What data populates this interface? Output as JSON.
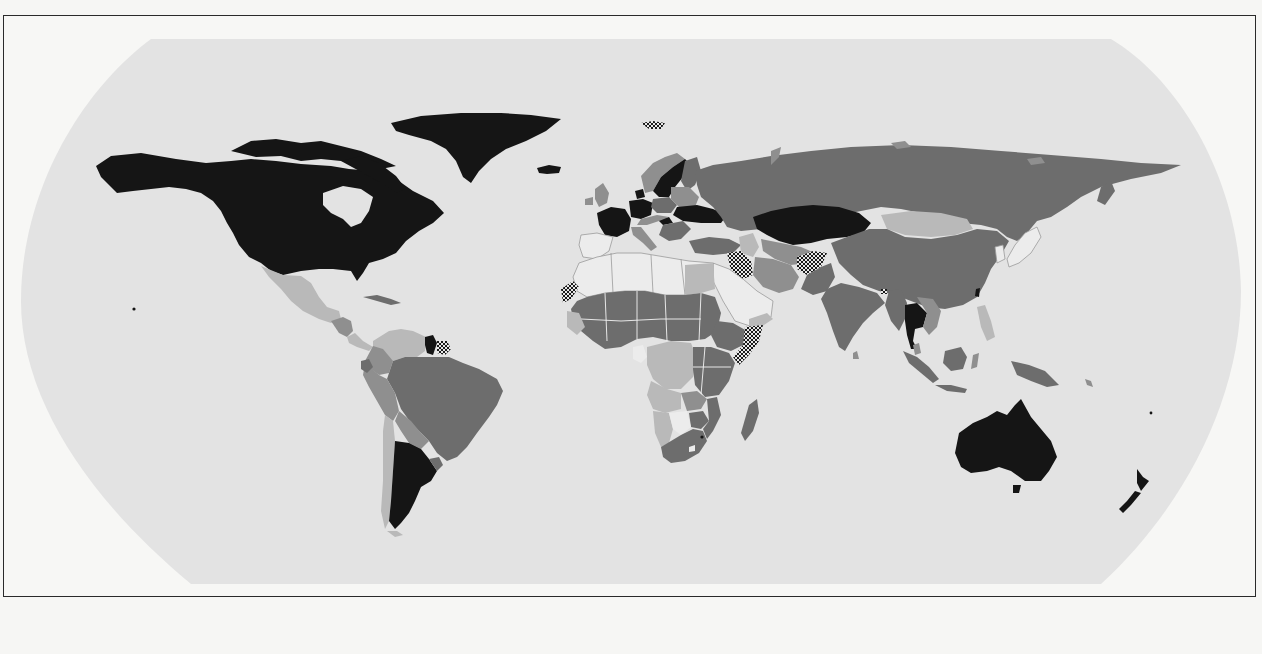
{
  "map": {
    "projection": "Robinson-style world choropleth (grayscale print)",
    "colors": {
      "paper": "#f7f7f5",
      "ocean": "#e4e4e4",
      "frame_border": "#2a2a2a",
      "category_black": "#151515",
      "category_dark_gray": "#6d6d6d",
      "category_mid_gray": "#8f8f8f",
      "category_light_gray": "#b9b9b9",
      "category_pale": "#ececec",
      "category_hatched": "checker pattern"
    },
    "legend_visible": false,
    "title_visible": false,
    "categories": [
      {
        "id": "black",
        "regions": [
          "Canada",
          "United States",
          "Greenland",
          "France",
          "Germany",
          "Denmark",
          "Sweden",
          "Ukraine",
          "Hungary",
          "Kazakhstan",
          "Thailand",
          "Australia",
          "New Zealand",
          "Argentina",
          "Guyana",
          "Taiwan",
          "Swaziland",
          "Iceland"
        ]
      },
      {
        "id": "dark_gray",
        "regions": [
          "Russia",
          "China",
          "India",
          "Brazil",
          "Turkey",
          "South Africa",
          "Madagascar",
          "Indonesia",
          "Papua New Guinea",
          "Ethiopia",
          "Kenya",
          "Tanzania",
          "Zimbabwe",
          "Mozambique",
          "Sudan",
          "Chad",
          "Niger",
          "Nigeria",
          "Mali",
          "Myanmar",
          "Pakistan",
          "Finland",
          "Poland",
          "Romania",
          "Uruguay",
          "Ecuador",
          "Guatemala",
          "Bolivia"
        ]
      },
      {
        "id": "mid_gray",
        "regions": [
          "Norway",
          "United Kingdom",
          "Ireland",
          "Italy",
          "Belarus",
          "Baltic states",
          "Iran",
          "Turkmenistan",
          "Uzbekistan",
          "Vietnam",
          "Laos",
          "Cambodia",
          "Malaysia",
          "Philippines",
          "Colombia",
          "Peru",
          "Paraguay",
          "Zambia",
          "Uganda",
          "Cameroon",
          "Central African Republic",
          "Senegal",
          "Mauritania",
          "Guinea"
        ]
      },
      {
        "id": "light_gray",
        "regions": [
          "Mexico",
          "Mongolia",
          "Venezuela",
          "Chile",
          "Democratic Republic of the Congo",
          "Angola",
          "Namibia",
          "Egypt",
          "Yemen",
          "Honduras",
          "Nicaragua",
          "Spain region"
        ]
      },
      {
        "id": "pale",
        "regions": [
          "Saudi Arabia",
          "Algeria",
          "Libya",
          "Morocco",
          "Tunisia",
          "Oman",
          "Botswana",
          "Gabon",
          "Japan",
          "South Korea",
          "North Korea",
          "Cuba",
          "Portugal",
          "Spain",
          "Lesotho"
        ]
      },
      {
        "id": "hatched",
        "regions": [
          "Iraq",
          "Afghanistan",
          "Somalia",
          "Western Sahara",
          "Svalbard",
          "Suriname / French Guiana",
          "Bhutan"
        ]
      }
    ],
    "ghost_text_note": "faint show-through text from reverse side of page, illegible"
  }
}
